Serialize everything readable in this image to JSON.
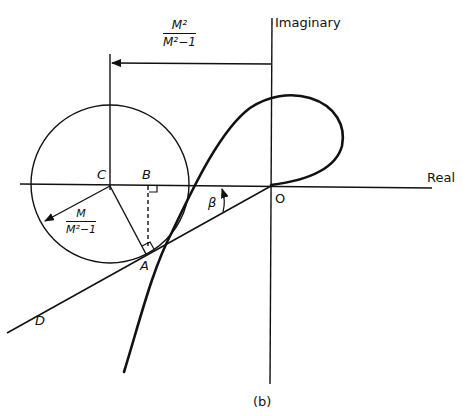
{
  "figure": {
    "caption": "(b)",
    "axes": {
      "real_label": "Real",
      "imaginary_label": "Imaginary"
    },
    "points": {
      "origin": "O",
      "center": "C",
      "foot": "B",
      "tangent_point": "A",
      "line_end": "D"
    },
    "angle_label": "β",
    "center_distance": {
      "numerator": "M²",
      "denominator": "M²−1"
    },
    "radius": {
      "numerator": "M",
      "denominator": "M²−1"
    }
  }
}
